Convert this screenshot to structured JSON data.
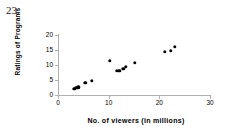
{
  "question": {
    "number": "23."
  },
  "chart_data": {
    "type": "scatter",
    "title": "",
    "xlabel": "No. of viewers (in millions)",
    "ylabel": "Ratings of Programs",
    "xlim": [
      0,
      30
    ],
    "ylim": [
      0,
      20
    ],
    "xticks": [
      0,
      10,
      20,
      30
    ],
    "yticks": [
      0,
      5,
      10,
      15,
      20
    ],
    "xtick_labels": [
      "0",
      "10",
      "20",
      "30"
    ],
    "ytick_labels": [
      "0",
      "5",
      "10",
      "15",
      "20"
    ],
    "grid": false,
    "legend": false,
    "marker": "filled-circle",
    "marker_color": "#000000",
    "series": [
      {
        "name": "Programs",
        "points": [
          [
            3.2,
            2.1
          ],
          [
            3.6,
            2.4
          ],
          [
            4.0,
            2.6
          ],
          [
            5.4,
            4.0
          ],
          [
            6.7,
            4.7
          ],
          [
            10.2,
            11.5
          ],
          [
            11.6,
            8.1
          ],
          [
            12.1,
            8.0
          ],
          [
            12.9,
            8.8
          ],
          [
            13.4,
            9.4
          ],
          [
            15.1,
            10.7
          ],
          [
            21.1,
            14.4
          ],
          [
            22.3,
            14.8
          ],
          [
            23.1,
            16.1
          ]
        ]
      }
    ]
  }
}
